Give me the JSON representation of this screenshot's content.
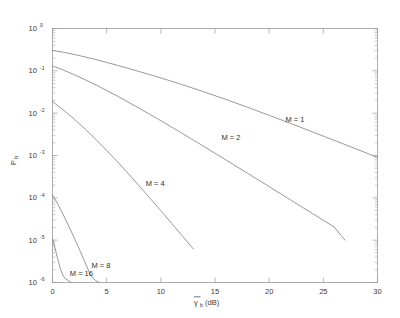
{
  "chart_data": {
    "type": "line",
    "title": "",
    "subtitle": "",
    "xlabel": "γ̄b (dB)",
    "xlabel_main": "γ",
    "xlabel_sub": "b",
    "xlabel_unit": "(dB)",
    "ylabel": "Pb",
    "ylabel_main": "P",
    "ylabel_sub": "b",
    "xlim": [
      0,
      30
    ],
    "ylim": [
      1e-06,
      1
    ],
    "yscale": "log",
    "xscale": "linear",
    "grid": false,
    "legend_position": "inline-annotations",
    "xticks": [
      0,
      5,
      10,
      15,
      20,
      25,
      30
    ],
    "xtick_labels": [
      "0",
      "5",
      "10",
      "15",
      "20",
      "25",
      "30"
    ],
    "yticks": [
      1,
      0.1,
      0.01,
      0.001,
      0.0001,
      1e-05,
      1e-06
    ],
    "ytick_labels": [
      "10^0",
      "10^-1",
      "10^-2",
      "10^-3",
      "10^-4",
      "10^-5",
      "10^-6"
    ],
    "ytick_bases": [
      "10",
      "10",
      "10",
      "10",
      "10",
      "10",
      "10"
    ],
    "ytick_exponents": [
      "0",
      "-1",
      "-2",
      "-3",
      "-4",
      "-5",
      "-6"
    ],
    "series": [
      {
        "name": "M = 1",
        "label": "M = 1",
        "annotation_x": 21.5,
        "annotation_y": 0.0063,
        "x": [
          0,
          1,
          2,
          3,
          4,
          5,
          6,
          8,
          10,
          12,
          14,
          16,
          18,
          20,
          22,
          24,
          26,
          28,
          30
        ],
        "y": [
          0.3045,
          0.2744,
          0.2436,
          0.2132,
          0.1845,
          0.1582,
          0.1348,
          0.0964,
          0.068,
          0.047,
          0.0318,
          0.0211,
          0.0138,
          0.0089,
          0.00569,
          0.00361,
          0.00228,
          0.00144,
          0.0009
        ]
      },
      {
        "name": "M = 2",
        "label": "M = 2",
        "annotation_x": 15.6,
        "annotation_y": 0.0023,
        "x": [
          0,
          1,
          2,
          3,
          4,
          5,
          6,
          8,
          10,
          12,
          14,
          16,
          18,
          20,
          22,
          24,
          26,
          27
        ],
        "y": [
          0.1304,
          0.1043,
          0.0812,
          0.062,
          0.0465,
          0.0344,
          0.0252,
          0.0131,
          0.00664,
          0.0033,
          0.00162,
          0.000788,
          0.000381,
          0.000184,
          8.85e-05,
          4.25e-05,
          2.04e-05,
          1e-05
        ]
      },
      {
        "name": "M = 4",
        "label": "M = 4",
        "annotation_x": 8.6,
        "annotation_y": 0.00019,
        "x": [
          0,
          1,
          2,
          3,
          4,
          5,
          6,
          7,
          8,
          9,
          10,
          11,
          12,
          13
        ],
        "y": [
          0.0188,
          0.0119,
          0.00726,
          0.00425,
          0.0024,
          0.00132,
          0.000707,
          0.000371,
          0.000192,
          9.8e-05,
          4.96e-05,
          2.49e-05,
          1.24e-05,
          6.2e-06
        ]
      },
      {
        "name": "M = 8",
        "label": "M = 8",
        "annotation_x": 3.6,
        "annotation_y": 2.2e-06,
        "x": [
          0,
          0.5,
          1,
          1.5,
          2,
          2.5,
          3,
          3.5,
          4,
          4.3
        ],
        "y": [
          0.000118,
          7e-05,
          3.96e-05,
          2.16e-05,
          1.14e-05,
          5.9e-06,
          3e-06,
          1.5e-06,
          1.1e-06,
          1e-06
        ]
      },
      {
        "name": "M = 16",
        "label": "M = 16",
        "annotation_x": 1.6,
        "annotation_y": 1.4e-06,
        "x": [
          0,
          0.25,
          0.5,
          0.75,
          1,
          1.25,
          1.5,
          1.7
        ],
        "y": [
          1.08e-05,
          6.2e-06,
          3.5e-06,
          2e-06,
          1.4e-06,
          1.2e-06,
          1.1e-06,
          1e-06
        ]
      }
    ]
  },
  "colors": {
    "background": "#ffffff",
    "axis": "#9a9a9a",
    "curve": "#8c8c8c",
    "text": "#3a3a3a"
  }
}
